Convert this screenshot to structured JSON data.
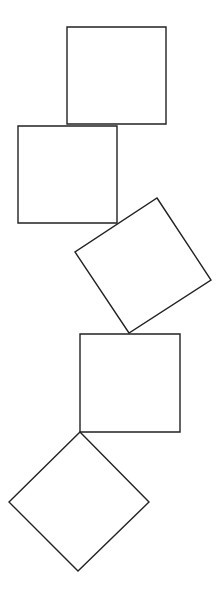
{
  "diagram": {
    "width": 224,
    "height": 594,
    "background": "#ffffff",
    "stroke_color": "#222222",
    "stroke_width": 1.4,
    "shapes": [
      {
        "id": "square-1",
        "kind": "square",
        "orientation": "upright",
        "points": "67,27 166,27 166,124 67,124"
      },
      {
        "id": "square-2",
        "kind": "square",
        "orientation": "upright",
        "points": "18,126 117,126 117,223 18,223"
      },
      {
        "id": "square-3",
        "kind": "square",
        "orientation": "rotated ~33deg",
        "points": "157,198 211,280 129,333 75,252"
      },
      {
        "id": "square-4",
        "kind": "square",
        "orientation": "upright",
        "points": "80,334 180,334 180,432 80,432"
      },
      {
        "id": "square-5",
        "kind": "square",
        "orientation": "rotated 45deg (diamond)",
        "points": "80,432 149,502 78,571 9,502"
      }
    ]
  }
}
